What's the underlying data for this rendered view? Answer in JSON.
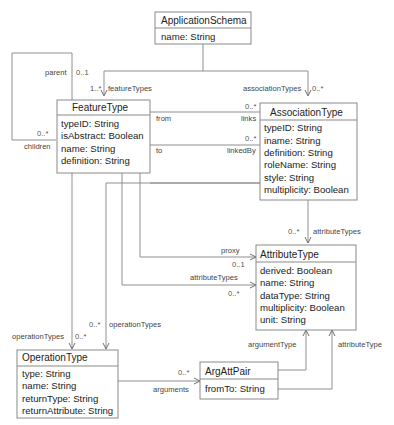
{
  "classes": {
    "application_schema": {
      "name": "ApplicationSchema",
      "attributes": [
        "name: String"
      ]
    },
    "feature_type": {
      "name": "FeatureType",
      "attributes": [
        "typeID: String",
        "isAbstract: Boolean",
        "name: String",
        "definition: String"
      ]
    },
    "association_type": {
      "name": "AssociationType",
      "attributes": [
        "typeID: String",
        "iname: String",
        "definition: String",
        "roleName: String",
        "style: String",
        "multiplicity: Boolean"
      ]
    },
    "attribute_type": {
      "name": "AttributeType",
      "attributes": [
        "derived: Boolean",
        "name: String",
        "dataType: String",
        "multiplicity: Boolean",
        "unit: String"
      ]
    },
    "operation_type": {
      "name": "OperationType",
      "attributes": [
        "type: String",
        "name: String",
        "returnType: String",
        "returnAttribute: String"
      ]
    },
    "arg_att_pair": {
      "name": "ArgAttPair",
      "attributes": [
        "fromTo: String"
      ]
    }
  },
  "associations": {
    "feature_types": {
      "role": "featureTypes",
      "multiplicity": "1..*"
    },
    "association_types": {
      "role": "associationTypes",
      "multiplicity": "0..*"
    },
    "parent": {
      "role": "parent",
      "multiplicity": "0..1"
    },
    "children": {
      "role": "children",
      "multiplicity": "0..*"
    },
    "from_links": {
      "source_role": "from",
      "role": "links",
      "multiplicity": "0..*"
    },
    "to_linked_by": {
      "source_role": "to",
      "role": "linkedBy",
      "multiplicity": "0..*"
    },
    "assoc_attribute_types": {
      "role": "attributeTypes",
      "multiplicity": "0..*"
    },
    "proxy": {
      "role": "proxy",
      "multiplicity": "0..1"
    },
    "feature_attribute_types": {
      "role": "attributeTypes",
      "multiplicity": "0..*"
    },
    "feature_operation_types": {
      "role": "operationTypes",
      "multiplicity": "0..*"
    },
    "other_operation_types": {
      "role": "operationTypes",
      "multiplicity": "0..*"
    },
    "arguments": {
      "role": "arguments",
      "multiplicity": "0..*"
    },
    "argument_type": {
      "role": "argumentType"
    },
    "attribute_type": {
      "role": "attributeType"
    }
  }
}
